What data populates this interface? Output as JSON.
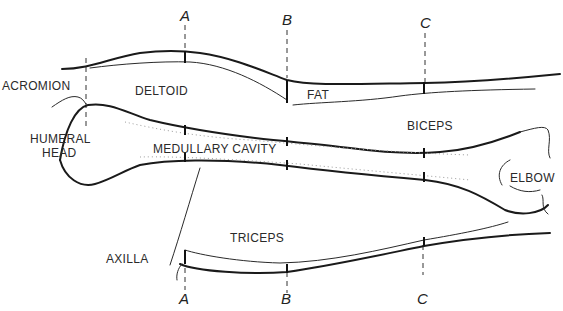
{
  "section_markers": {
    "a_top": "A",
    "b_top": "B",
    "c_top": "C",
    "a_bottom": "A",
    "b_bottom": "B",
    "c_bottom": "C"
  },
  "labels": {
    "acromion": "ACROMION",
    "deltoid": "DELTOID",
    "fat": "FAT",
    "biceps": "BICEPS",
    "humeral_head_line1": "HUMERAL",
    "humeral_head_line2": "HEAD",
    "medullary_cavity": "MEDULLARY CAVITY",
    "elbow": "ELBOW",
    "triceps": "TRICEPS",
    "axilla": "AXILLA"
  }
}
